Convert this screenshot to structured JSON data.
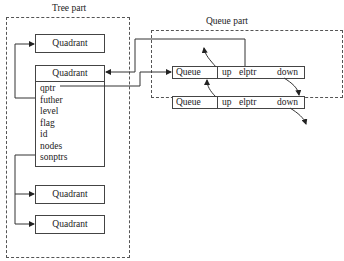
{
  "tree_part": {
    "title": "Tree part",
    "top_quadrant": "Quadrant",
    "main_quadrant": {
      "header": "Quadrant",
      "fields": [
        "qptr",
        "futher",
        "level",
        "flag",
        "id",
        "nodes",
        "sonptrs"
      ]
    },
    "child_quadrants": [
      "Quadrant",
      "Quadrant"
    ]
  },
  "queue_part": {
    "title": "Queue part",
    "rows": [
      {
        "name": "Queue",
        "up": "up",
        "elptr": "elptr",
        "down": "down"
      },
      {
        "name": "Queue",
        "up": "up",
        "elptr": "elptr",
        "down": "down"
      }
    ]
  }
}
